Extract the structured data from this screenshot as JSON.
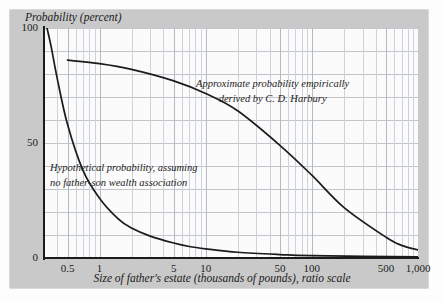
{
  "figure": {
    "y_axis_title": "Probability (percent)",
    "x_axis_title": "Size of father's estate (thousands of pounds), ratio scale",
    "annotation_empirical_line1": "Approximate probability empirically",
    "annotation_empirical_line2": "derived by C. D. Harbury",
    "annotation_hypothetical_line1": "Hypothetical probability, assuming",
    "annotation_hypothetical_line2": "no father-son wealth association",
    "frame_color": "#c9c9c9",
    "panel_color": "#fbfbfb",
    "grid_color": "#c0c6cc",
    "curve_color": "#1b1b1b"
  },
  "chart_data": {
    "type": "line",
    "title": "",
    "xlabel": "Size of father's estate (thousands of pounds), ratio scale",
    "ylabel": "Probability (percent)",
    "x_scale": "log",
    "xlim": [
      0.3,
      1000
    ],
    "ylim": [
      0,
      100
    ],
    "grid": true,
    "legend": "annotations-inline",
    "x_ticks": [
      {
        "value": 0.5,
        "label": "0.5"
      },
      {
        "value": 1,
        "label": "1"
      },
      {
        "value": 5,
        "label": "5"
      },
      {
        "value": 10,
        "label": "10"
      },
      {
        "value": 50,
        "label": "50"
      },
      {
        "value": 100,
        "label": "100"
      },
      {
        "value": 500,
        "label": "500"
      },
      {
        "value": 1000,
        "label": "1,000"
      }
    ],
    "y_ticks": [
      {
        "value": 0,
        "label": "0"
      },
      {
        "value": 50,
        "label": "50"
      },
      {
        "value": 100,
        "label": "100"
      }
    ],
    "y_gridline_values": [
      0,
      10,
      20,
      30,
      40,
      50,
      60,
      70,
      80,
      90,
      100
    ],
    "series": [
      {
        "name": "Approximate probability empirically derived by C. D. Harbury",
        "x": [
          0.5,
          1,
          2,
          5,
          10,
          20,
          50,
          100,
          200,
          500,
          700,
          1000
        ],
        "y": [
          86,
          84.5,
          82,
          77,
          71.5,
          64,
          49,
          36,
          22,
          9,
          5.5,
          3.5
        ]
      },
      {
        "name": "Hypothetical probability, assuming no father-son wealth association",
        "x": [
          0.32,
          0.35,
          0.4,
          0.5,
          0.7,
          1,
          1.5,
          2,
          3,
          5,
          7,
          10,
          20,
          50,
          100,
          1000
        ],
        "y": [
          100,
          92,
          78,
          58,
          38,
          26,
          17,
          13,
          9.5,
          6.5,
          5,
          4,
          2.5,
          1.5,
          1,
          0.5
        ]
      }
    ]
  }
}
